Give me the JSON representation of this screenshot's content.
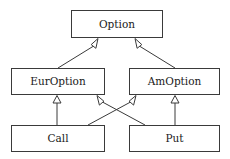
{
  "diagram": {
    "kind": "uml-class-hierarchy",
    "background_color": "#ffffff",
    "line_color": "#3a3a3a",
    "text_color": "#1a1a1a",
    "classes": [
      {
        "id": "option",
        "label": "Option",
        "x": 71,
        "y": 10,
        "w": 92,
        "h": 28
      },
      {
        "id": "euroption",
        "label": "EurOption",
        "x": 11,
        "y": 68,
        "w": 94,
        "h": 27
      },
      {
        "id": "amoption",
        "label": "AmOption",
        "x": 129,
        "y": 68,
        "w": 91,
        "h": 27
      },
      {
        "id": "call",
        "label": "Call",
        "x": 11,
        "y": 125,
        "w": 94,
        "h": 27
      },
      {
        "id": "put",
        "label": "Put",
        "x": 129,
        "y": 125,
        "w": 91,
        "h": 27
      }
    ],
    "generalizations": [
      {
        "id": "euroption-to-option",
        "from": "EurOption",
        "to": "Option",
        "arrow": "hollow-triangle",
        "style": "diagonal"
      },
      {
        "id": "amoption-to-option",
        "from": "AmOption",
        "to": "Option",
        "arrow": "hollow-triangle",
        "style": "diagonal"
      },
      {
        "id": "call-to-euroption",
        "from": "Call",
        "to": "EurOption",
        "arrow": "hollow-triangle",
        "style": "vertical"
      },
      {
        "id": "call-to-amoption",
        "from": "Call",
        "to": "AmOption",
        "arrow": "hollow-triangle",
        "style": "diagonal-crossing"
      },
      {
        "id": "put-to-euroption",
        "from": "Put",
        "to": "EurOption",
        "arrow": "hollow-triangle",
        "style": "diagonal-crossing"
      },
      {
        "id": "put-to-amoption",
        "from": "Put",
        "to": "AmOption",
        "arrow": "hollow-triangle",
        "style": "vertical"
      }
    ]
  }
}
